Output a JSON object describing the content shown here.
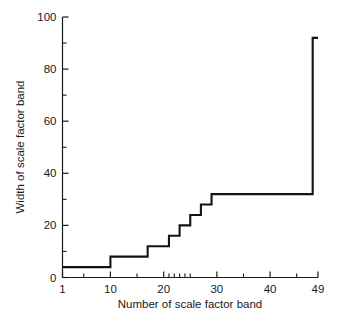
{
  "chart_data": {
    "type": "line",
    "subtype": "step",
    "title": "",
    "xlabel": "Number of scale factor band",
    "ylabel": "Width of scale factor band",
    "xlim": [
      1,
      49
    ],
    "ylim": [
      0,
      100
    ],
    "grid": false,
    "legend": null,
    "x_ticks_major": [
      1,
      10,
      20,
      30,
      40,
      49
    ],
    "x_tick_labels": [
      "1",
      "10",
      "20",
      "30",
      "40",
      "49"
    ],
    "x_ticks_minor": [
      5,
      15,
      21,
      22,
      23,
      24,
      25,
      35,
      45
    ],
    "y_ticks_major": [
      0,
      20,
      40,
      60,
      80,
      100
    ],
    "y_tick_labels": [
      "0",
      "20",
      "40",
      "60",
      "80",
      "100"
    ],
    "y_ticks_minor": [
      10,
      30,
      50,
      70,
      90
    ],
    "series": [
      {
        "name": "Width of scale factor band",
        "x": [
          1,
          10,
          17,
          21,
          23,
          25,
          27,
          29,
          30,
          48,
          49,
          49
        ],
        "values": [
          4,
          4,
          8,
          12,
          16,
          20,
          24,
          28,
          32,
          32,
          32,
          92
        ],
        "steps": [
          {
            "x_start": 1,
            "x_end": 10,
            "width": 4
          },
          {
            "x_start": 10,
            "x_end": 17,
            "width": 8
          },
          {
            "x_start": 17,
            "x_end": 21,
            "width": 12
          },
          {
            "x_start": 21,
            "x_end": 23,
            "width": 16
          },
          {
            "x_start": 23,
            "x_end": 25,
            "width": 20
          },
          {
            "x_start": 25,
            "x_end": 27,
            "width": 24
          },
          {
            "x_start": 27,
            "x_end": 29,
            "width": 28
          },
          {
            "x_start": 29,
            "x_end": 48,
            "width": 32
          },
          {
            "x_start": 48,
            "x_end": 49,
            "width": 92
          }
        ]
      }
    ]
  },
  "caption": {
    "fragment": ""
  }
}
